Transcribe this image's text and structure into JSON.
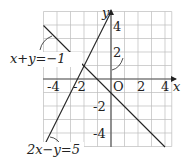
{
  "chart_data": {
    "type": "line",
    "title": "",
    "xlabel": "x",
    "ylabel": "y",
    "origin_label": "O",
    "xlim": [
      -5,
      4.5
    ],
    "ylim": [
      -5,
      5
    ],
    "grid": true,
    "x_ticks": [
      "-4",
      "-2",
      "2",
      "4"
    ],
    "y_ticks": [
      "4",
      "2",
      "-2",
      "-4"
    ],
    "series": [
      {
        "name": "x+y=-1",
        "label": "x+y=−1",
        "x": [
          -5,
          4
        ],
        "y": [
          4,
          -5
        ]
      },
      {
        "name": "2x-y=5",
        "label": "2x−y=5",
        "x": [
          -5,
          0
        ],
        "y": [
          -5,
          5
        ]
      }
    ],
    "intersection": {
      "x": -2,
      "y": 1
    }
  }
}
